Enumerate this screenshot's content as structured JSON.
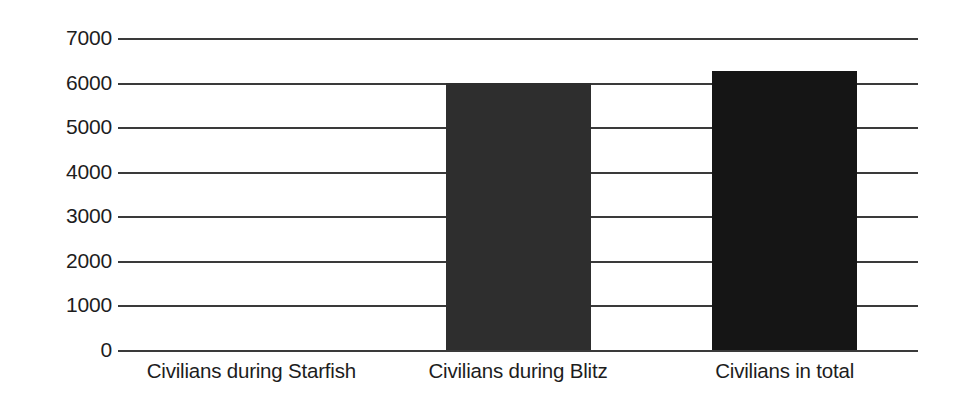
{
  "chart_data": {
    "type": "bar",
    "title": "",
    "subtitle": "",
    "xlabel": "",
    "ylabel": "",
    "categories": [
      "Civilians during Starfish",
      "Civilians during Blitz",
      "Civilians in total"
    ],
    "values": [
      0,
      6000,
      6270
    ],
    "series": [
      {
        "name": "Civilian casualties",
        "values": [
          0,
          6000,
          6270
        ]
      }
    ],
    "bar_colors": [
      "#2e2e2e",
      "#2e2e2e",
      "#151515"
    ],
    "ylim": [
      0,
      7000
    ],
    "ytick_step": 1000,
    "ytick_labels": [
      "7000",
      "6000",
      "5000",
      "4000",
      "3000",
      "2000",
      "1000",
      "0"
    ],
    "ytick_values": [
      7000,
      6000,
      5000,
      4000,
      3000,
      2000,
      1000,
      0
    ],
    "grid": true,
    "grid_axis": "y",
    "grid_color": "#3a3a3a",
    "legend": false,
    "legend_position": "none",
    "background_color": "#ffffff",
    "text_color": "#1d1d1d",
    "annotations": []
  }
}
